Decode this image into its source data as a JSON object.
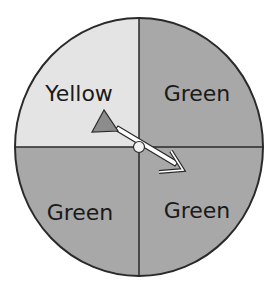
{
  "spinner": {
    "sections": [
      {
        "label": "Yellow",
        "position": "top-left",
        "fill": "#e4e4e4"
      },
      {
        "label": "Green",
        "position": "top-right",
        "fill": "#a8a8a8"
      },
      {
        "label": "Green",
        "position": "bottom-left",
        "fill": "#a8a8a8"
      },
      {
        "label": "Green",
        "position": "bottom-right",
        "fill": "#a8a8a8"
      }
    ],
    "outline_color": "#2a2a2a",
    "arrow_fill": "#8c8c8c",
    "arrow_points_to": "Green"
  }
}
